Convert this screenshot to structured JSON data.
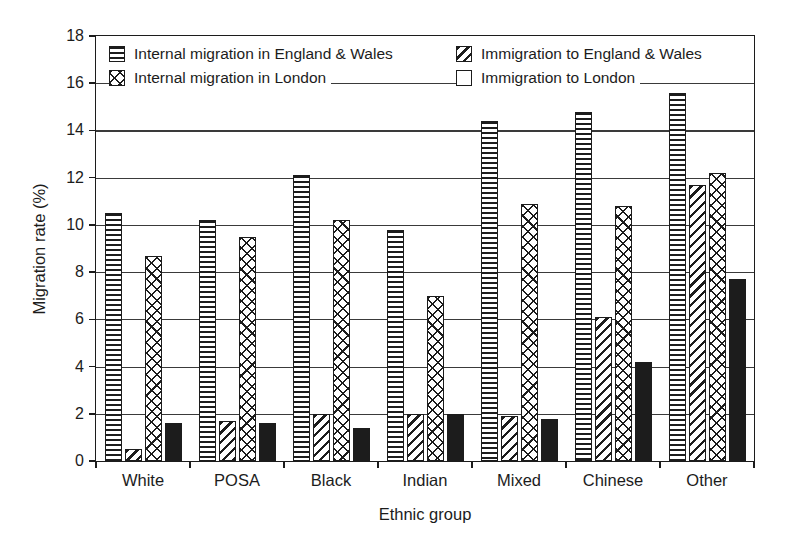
{
  "figure": {
    "background": "#ffffff",
    "ink_color": "#1c1c1c"
  },
  "chart_data": {
    "type": "bar",
    "title": "",
    "xlabel": "Ethnic group",
    "ylabel": "Migration rate (%)",
    "ylim": [
      0,
      18
    ],
    "ytick_step": 2,
    "yticks": [
      0,
      2,
      4,
      6,
      8,
      10,
      12,
      14,
      16,
      18
    ],
    "grid": "horizontal",
    "categories": [
      "White",
      "POSA",
      "Black",
      "Indian",
      "Mixed",
      "Chinese",
      "Other"
    ],
    "series": [
      {
        "name": "Internal migration in England & Wales",
        "pattern": "horizontal-stripes",
        "values": [
          10.5,
          10.2,
          12.1,
          9.8,
          14.4,
          14.8,
          15.6
        ]
      },
      {
        "name": "Immigration to England & Wales",
        "pattern": "diagonal-stripes",
        "values": [
          0.5,
          1.7,
          2.0,
          2.0,
          1.9,
          6.1,
          11.7
        ]
      },
      {
        "name": "Internal migration in London",
        "pattern": "crosshatch",
        "values": [
          8.7,
          9.5,
          10.2,
          7.0,
          10.9,
          10.8,
          12.2
        ]
      },
      {
        "name": "Immigration to London",
        "pattern": "solid-black",
        "values": [
          1.6,
          1.6,
          1.4,
          2.0,
          1.8,
          4.2,
          7.7
        ]
      }
    ],
    "legend": {
      "position": "top-inside",
      "columns": [
        [
          0,
          2
        ],
        [
          1,
          3
        ]
      ],
      "column_x_px": [
        13,
        360
      ],
      "row_y_px": [
        8,
        32
      ]
    }
  }
}
